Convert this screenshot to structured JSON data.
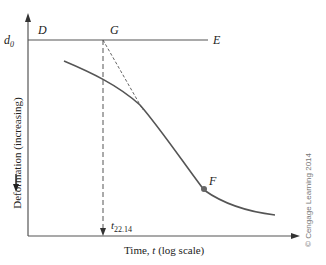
{
  "figure": {
    "type": "consolidation-curve-log-time",
    "colors": {
      "axis": "#444444",
      "curve": "#555555",
      "text": "#222222",
      "copyright": "#777777"
    },
    "labels": {
      "d0_symbol": "d",
      "d0_subscript": "0",
      "point_D": "D",
      "point_G": "G",
      "point_E": "E",
      "point_F": "F",
      "t_symbol": "t",
      "t_subscript": "22.14",
      "x_axis_label_prefix": "Time, ",
      "x_axis_label_var": "t",
      "x_axis_label_suffix": " (log scale)",
      "y_axis_label": "Deformation (increasing)",
      "copyright": "© Cengage Learning 2014"
    }
  }
}
